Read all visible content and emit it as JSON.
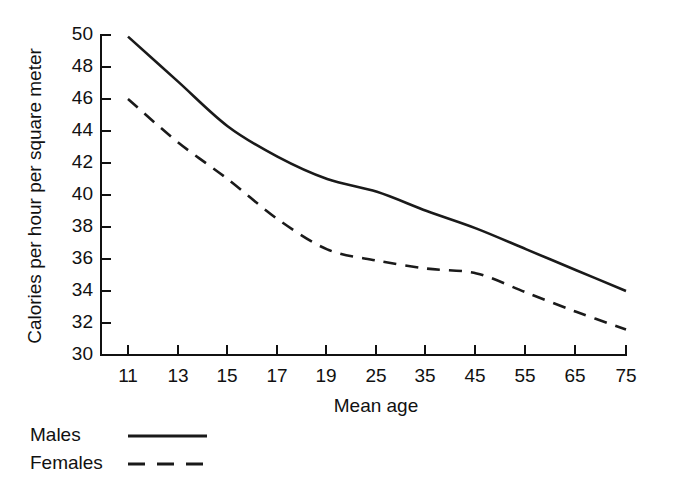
{
  "chart_data": {
    "type": "line",
    "title": "",
    "subtitle": "",
    "xlabel": "Mean age",
    "ylabel": "Calories per hour per square meter",
    "categories": [
      "11",
      "13",
      "15",
      "17",
      "19",
      "25",
      "35",
      "45",
      "55",
      "65",
      "75"
    ],
    "x_tick_labels": [
      "11",
      "13",
      "15",
      "17",
      "19",
      "25",
      "35",
      "45",
      "55",
      "65",
      "75"
    ],
    "y_tick_labels": [
      "30",
      "32",
      "34",
      "36",
      "38",
      "40",
      "42",
      "44",
      "46",
      "48",
      "50"
    ],
    "y_ticks": [
      30,
      32,
      34,
      36,
      38,
      40,
      42,
      44,
      46,
      48,
      50
    ],
    "ylim": [
      30,
      50
    ],
    "grid": false,
    "legend_position": "below-axes-left",
    "series": [
      {
        "name": "Males",
        "style": "solid",
        "color": "#1a1a1a",
        "values": [
          49.9,
          47.1,
          44.3,
          42.4,
          41.0,
          40.2,
          39.0,
          37.9,
          36.6,
          35.3,
          34.0
        ]
      },
      {
        "name": "Females",
        "style": "dashed",
        "color": "#1a1a1a",
        "values": [
          46.0,
          43.3,
          41.0,
          38.5,
          36.6,
          35.9,
          35.4,
          35.1,
          33.9,
          32.7,
          31.6
        ]
      }
    ],
    "legend": [
      {
        "label": "Males",
        "style": "solid"
      },
      {
        "label": "Females",
        "style": "dashed"
      }
    ]
  },
  "axes": {
    "x_title": "Mean age",
    "y_title": "Calories per hour per square meter"
  },
  "legend": {
    "males_label": "Males",
    "females_label": "Females"
  },
  "ticks": {
    "x": [
      "11",
      "13",
      "15",
      "17",
      "19",
      "25",
      "35",
      "45",
      "55",
      "65",
      "75"
    ],
    "y": [
      "30",
      "32",
      "34",
      "36",
      "38",
      "40",
      "42",
      "44",
      "46",
      "48",
      "50"
    ]
  }
}
